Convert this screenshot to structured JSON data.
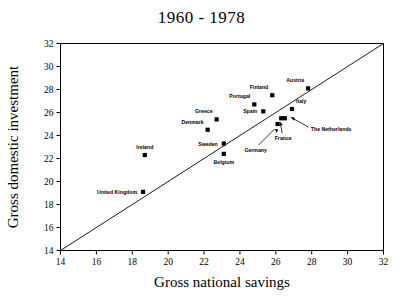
{
  "chart_data": {
    "type": "scatter",
    "title": "1960 - 1978",
    "xlabel": "Gross national savings",
    "ylabel": "Gross domestic investment",
    "xlim": [
      14,
      32
    ],
    "ylim": [
      14,
      32
    ],
    "xticks": [
      14,
      16,
      18,
      20,
      22,
      24,
      26,
      28,
      30,
      32
    ],
    "yticks": [
      14,
      16,
      18,
      20,
      22,
      24,
      26,
      28,
      30,
      32
    ],
    "grid": false,
    "legend": "none",
    "reference_line": {
      "name": "identity-line",
      "from": [
        14,
        14
      ],
      "to": [
        32,
        32
      ]
    },
    "points": [
      {
        "label": "United Kingdom",
        "x": 18.6,
        "y": 19.1,
        "label_pos": "left"
      },
      {
        "label": "Ireland",
        "x": 18.7,
        "y": 22.3,
        "label_pos": "above"
      },
      {
        "label": "Denmark",
        "x": 22.2,
        "y": 24.5,
        "label_pos": "above-left"
      },
      {
        "label": "Greece",
        "x": 22.7,
        "y": 25.4,
        "label_pos": "above-left"
      },
      {
        "label": "Sweden",
        "x": 23.1,
        "y": 23.3,
        "label_pos": "left"
      },
      {
        "label": "Belgium",
        "x": 23.1,
        "y": 22.4,
        "label_pos": "below"
      },
      {
        "label": "Portugal",
        "x": 24.8,
        "y": 26.7,
        "label_pos": "above-left"
      },
      {
        "label": "Spain",
        "x": 25.3,
        "y": 26.1,
        "label_pos": "left"
      },
      {
        "label": "Finland",
        "x": 25.8,
        "y": 27.5,
        "label_pos": "above-left"
      },
      {
        "label": "Germany",
        "x": 26.1,
        "y": 25.0,
        "label_pos": "leader-below-left"
      },
      {
        "label": "France",
        "x": 26.3,
        "y": 25.5,
        "label_pos": "leader-below"
      },
      {
        "label": "The Netherlands",
        "x": 26.5,
        "y": 25.5,
        "label_pos": "leader-right"
      },
      {
        "label": "Italy",
        "x": 26.9,
        "y": 26.3,
        "label_pos": "above-right"
      },
      {
        "label": "Austria",
        "x": 27.8,
        "y": 28.1,
        "label_pos": "above-left"
      }
    ]
  }
}
